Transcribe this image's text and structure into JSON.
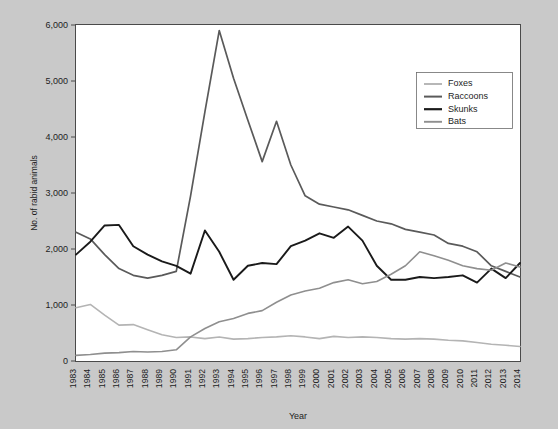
{
  "chart_data": {
    "type": "line",
    "title": "",
    "xlabel": "Year",
    "ylabel": "No. of rabid animals",
    "ylim": [
      0,
      6000
    ],
    "yticks": [
      "0",
      "1,000",
      "2,000",
      "3,000",
      "4,000",
      "5,000",
      "6,000"
    ],
    "ytick_values": [
      0,
      1000,
      2000,
      3000,
      4000,
      5000,
      6000
    ],
    "grid": false,
    "legend_position": "top-right",
    "categories": [
      "1983",
      "1984",
      "1985",
      "1986",
      "1987",
      "1988",
      "1989",
      "1990",
      "1991",
      "1992",
      "1993",
      "1994",
      "1995",
      "1996",
      "1997",
      "1998",
      "1999",
      "2000",
      "2001",
      "2002",
      "2003",
      "2004",
      "2005",
      "2006",
      "2007",
      "2008",
      "2009",
      "2010",
      "2011",
      "2012",
      "2013",
      "2014"
    ],
    "series": [
      {
        "name": "Foxes",
        "color": "#b4b4b4",
        "values": [
          950,
          1010,
          820,
          640,
          650,
          560,
          470,
          420,
          430,
          400,
          430,
          390,
          400,
          420,
          430,
          450,
          430,
          400,
          440,
          420,
          430,
          420,
          400,
          390,
          400,
          390,
          370,
          360,
          330,
          300,
          280,
          260
        ]
      },
      {
        "name": "Raccoons",
        "color": "#5a5a5a",
        "values": [
          2300,
          2180,
          1900,
          1650,
          1530,
          1480,
          1530,
          1600,
          2950,
          4450,
          5900,
          5050,
          4300,
          3560,
          4280,
          3500,
          2950,
          2800,
          2750,
          2700,
          2600,
          2500,
          2450,
          2350,
          2300,
          2250,
          2100,
          2050,
          1950,
          1700,
          1600,
          1500
        ]
      },
      {
        "name": "Skunks",
        "color": "#1a1a1a",
        "values": [
          1900,
          2130,
          2420,
          2430,
          2050,
          1900,
          1780,
          1700,
          1560,
          2330,
          1950,
          1450,
          1700,
          1750,
          1730,
          2050,
          2150,
          2280,
          2200,
          2400,
          2150,
          1700,
          1450,
          1450,
          1500,
          1480,
          1500,
          1530,
          1400,
          1650,
          1480,
          1750
        ]
      },
      {
        "name": "Bats",
        "color": "#8f8f8f",
        "values": [
          100,
          115,
          140,
          150,
          170,
          160,
          170,
          200,
          430,
          580,
          700,
          760,
          850,
          900,
          1050,
          1180,
          1250,
          1300,
          1400,
          1450,
          1380,
          1420,
          1550,
          1700,
          1950,
          1880,
          1800,
          1700,
          1650,
          1620,
          1750,
          1680
        ]
      }
    ]
  },
  "legend": {
    "items": [
      {
        "label": "Foxes"
      },
      {
        "label": "Raccoons"
      },
      {
        "label": "Skunks"
      },
      {
        "label": "Bats"
      }
    ]
  },
  "axes": {
    "x_title": "Year",
    "y_title": "No. of rabid animals"
  }
}
